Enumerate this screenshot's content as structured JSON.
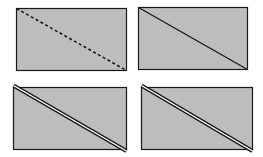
{
  "diagram": {
    "colors": {
      "fill": "#bdbdbd",
      "stroke": "#1a1a1a",
      "background": "#ffffff",
      "gap": "#ffffff"
    },
    "panels": [
      {
        "id": "dashed-diagonal",
        "style": "dashed",
        "rect": {
          "x": 16,
          "y": 8,
          "w": 110,
          "h": 62
        }
      },
      {
        "id": "solid-diagonal",
        "style": "solid",
        "rect": {
          "x": 138,
          "y": 7,
          "w": 109,
          "h": 62
        }
      },
      {
        "id": "double-diagonal-left",
        "style": "double",
        "rect": {
          "x": 13,
          "y": 87,
          "w": 113,
          "h": 62
        }
      },
      {
        "id": "double-diagonal-right",
        "style": "double",
        "rect": {
          "x": 141,
          "y": 87,
          "w": 111,
          "h": 62
        }
      }
    ]
  }
}
